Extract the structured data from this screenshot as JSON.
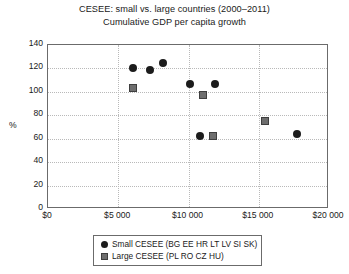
{
  "chart_data": {
    "type": "scatter",
    "title": "CESEE: small vs. large countries (2000–2011)",
    "subtitle": "Cumulative GDP per capita growth",
    "xlabel": "",
    "ylabel": "%",
    "xlim": [
      0,
      20000
    ],
    "ylim": [
      0,
      140
    ],
    "grid": true,
    "legend_position": "bottom-center",
    "xticks": [
      "$0",
      "$5 000",
      "$10 000",
      "$15 000",
      "$20 000"
    ],
    "xtick_values": [
      0,
      5000,
      10000,
      15000,
      20000
    ],
    "yticks": [
      "0",
      "20",
      "40",
      "60",
      "80",
      "100",
      "120",
      "140"
    ],
    "ytick_values": [
      0,
      20,
      40,
      60,
      80,
      100,
      120,
      140
    ],
    "series": [
      {
        "name": "Small CESEE (BG EE HR LT LV SI SK)",
        "marker": "circle",
        "color": "#1c1c1c",
        "points": [
          {
            "x": 6050,
            "y": 120
          },
          {
            "x": 7250,
            "y": 119
          },
          {
            "x": 8200,
            "y": 125
          },
          {
            "x": 10100,
            "y": 107
          },
          {
            "x": 11900,
            "y": 107
          },
          {
            "x": 10800,
            "y": 62
          },
          {
            "x": 17700,
            "y": 64
          }
        ]
      },
      {
        "name": "Large CESEE (PL RO CZ HU)",
        "marker": "square",
        "color": "#6e6e6e",
        "points": [
          {
            "x": 6050,
            "y": 103
          },
          {
            "x": 11000,
            "y": 97
          },
          {
            "x": 11750,
            "y": 62
          },
          {
            "x": 15450,
            "y": 75
          }
        ]
      }
    ]
  },
  "legend": {
    "items": [
      {
        "label": "Small CESEE (BG EE HR LT LV SI SK)",
        "marker": "circle"
      },
      {
        "label": "Large CESEE (PL RO CZ HU)",
        "marker": "square"
      }
    ]
  }
}
